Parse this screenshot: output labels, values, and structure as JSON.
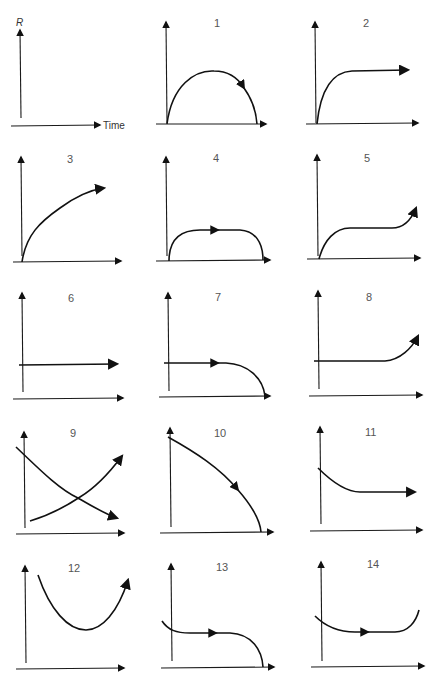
{
  "figure": {
    "axis_labels": {
      "y": "R",
      "x": "Time"
    },
    "panels": [
      {
        "id": "0",
        "label": "",
        "shape": "empty axes (legend panel)"
      },
      {
        "id": "1",
        "label": "1",
        "shape": "arch rising from zero and falling back to zero, arrow on descending side"
      },
      {
        "id": "2",
        "label": "2",
        "shape": "rapid rise then plateau, arrow at end"
      },
      {
        "id": "3",
        "label": "3",
        "shape": "continuous concave rise, arrow at end"
      },
      {
        "id": "4",
        "label": "4",
        "shape": "rise, flat plateau with arrow, then drop to zero"
      },
      {
        "id": "5",
        "label": "5",
        "shape": "rise, plateau, then rise again, arrow at end"
      },
      {
        "id": "6",
        "label": "6",
        "shape": "constant horizontal line, arrow at end"
      },
      {
        "id": "7",
        "label": "7",
        "shape": "constant with arrow, then falls to zero"
      },
      {
        "id": "8",
        "label": "8",
        "shape": "constant then rises, arrow at end"
      },
      {
        "id": "9",
        "label": "9",
        "shape": "two crossing curves: one decreasing, one increasing, both with arrows"
      },
      {
        "id": "10",
        "label": "10",
        "shape": "steady decline accelerating to zero, arrow midway"
      },
      {
        "id": "11",
        "label": "11",
        "shape": "decline then plateau, arrow at end"
      },
      {
        "id": "12",
        "label": "12",
        "shape": "U-shaped: decline then rise, arrow at end"
      },
      {
        "id": "13",
        "label": "13",
        "shape": "slight decline, plateau with arrow, then drop to zero"
      },
      {
        "id": "14",
        "label": "14",
        "shape": "slight decline, plateau with arrow, then rise"
      }
    ]
  }
}
